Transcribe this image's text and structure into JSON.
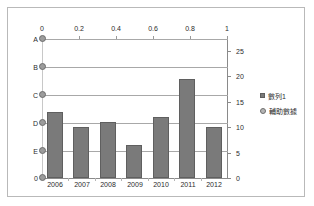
{
  "chart_data": {
    "type": "bar",
    "title": "",
    "xlabel": "",
    "ylabel": "",
    "categories": [
      "2006",
      "2007",
      "2008",
      "2009",
      "2010",
      "2011",
      "2012"
    ],
    "series": [
      {
        "name": "數列1",
        "axis": "right",
        "values": [
          13,
          10,
          11,
          6.5,
          12,
          19.5,
          10
        ]
      },
      {
        "name": "輔助數據",
        "axis": "top",
        "marker": "circle",
        "points": [
          {
            "label": "A",
            "x": 0
          },
          {
            "label": "B",
            "x": 0
          },
          {
            "label": "C",
            "x": 0
          },
          {
            "label": "D",
            "x": 0
          },
          {
            "label": "E",
            "x": 0
          },
          {
            "label": "0",
            "x": 0
          }
        ]
      }
    ],
    "axes": {
      "top": {
        "ticks": [
          "0",
          "0.2",
          "0.4",
          "0.6",
          "0.8",
          "1"
        ],
        "range": [
          0,
          1
        ]
      },
      "right": {
        "ticks": [
          "0",
          "5",
          "10",
          "15",
          "20",
          "25"
        ],
        "range": [
          0,
          27.5
        ]
      },
      "left": {
        "ticks": [
          "A",
          "B",
          "C",
          "D",
          "E",
          "0"
        ]
      },
      "bottom": {
        "ticks": [
          "2006",
          "2007",
          "2008",
          "2009",
          "2010",
          "2011",
          "2012"
        ]
      }
    },
    "gridlines": [
      "A",
      "B",
      "C",
      "D",
      "E"
    ],
    "grid": true,
    "legend": {
      "position": "right",
      "entries": [
        {
          "label": "數列1",
          "marker": "square",
          "color": "#7a7a7a"
        },
        {
          "label": "輔助數據",
          "marker": "circle",
          "color": "#b5b5b5"
        }
      ]
    },
    "colors": {
      "bar": "#7a7a7a",
      "bar_border": "#5f5f5f",
      "marker": "#9c9c9c",
      "gridline": "#a8a8a8",
      "axis": "#8a8a8a",
      "frame": "#b9b9b9",
      "background": "#ffffff",
      "text": "#2b2b2b"
    }
  }
}
